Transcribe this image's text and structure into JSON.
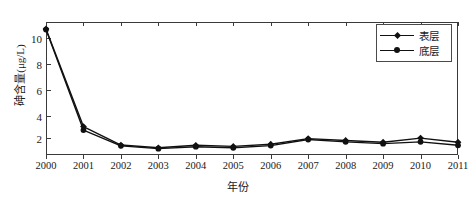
{
  "chart_data": {
    "type": "line",
    "title": "",
    "xlabel": "年份",
    "ylabel": "砷含量(μg/L)",
    "xlim": [
      2000,
      2011
    ],
    "ylim": [
      1.0,
      10.6
    ],
    "yticks": [
      2,
      4,
      6,
      8,
      10
    ],
    "grid": false,
    "legend_position": "top-right",
    "categories": [
      2000,
      2001,
      2002,
      2003,
      2004,
      2005,
      2006,
      2007,
      2008,
      2009,
      2010,
      2011
    ],
    "x": [
      "2000",
      "2001",
      "2002",
      "2003",
      "2004",
      "2005",
      "2006",
      "2007",
      "2008",
      "2009",
      "2010",
      "2011"
    ],
    "series": [
      {
        "name": "表层",
        "marker": "diamond",
        "color": "#111111",
        "values": [
          10.1,
          3.05,
          1.72,
          1.52,
          1.7,
          1.62,
          1.78,
          2.18,
          2.05,
          1.92,
          2.22,
          1.92
        ]
      },
      {
        "name": "底层",
        "marker": "circle",
        "color": "#111111",
        "values": [
          10.05,
          2.8,
          1.66,
          1.46,
          1.6,
          1.52,
          1.68,
          2.12,
          1.95,
          1.82,
          1.95,
          1.7
        ]
      }
    ]
  },
  "axes": {
    "y_tick_labels": [
      "10",
      "8",
      "6",
      "4",
      "2"
    ],
    "x_tick_labels": [
      "2000",
      "2001",
      "2002",
      "2003",
      "2004",
      "2005",
      "2006",
      "2007",
      "2008",
      "2009",
      "2010",
      "2011"
    ],
    "x_title": "年份",
    "y_title": "砷含量(μg/L)"
  },
  "legend": {
    "items": [
      {
        "label": "表层",
        "marker": "diamond-marker"
      },
      {
        "label": "底层",
        "marker": "circle-marker"
      }
    ]
  }
}
